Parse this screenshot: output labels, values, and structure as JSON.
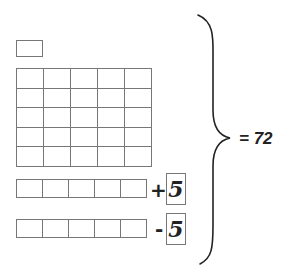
{
  "diagram": {
    "single_box": {
      "count": 1
    },
    "grid": {
      "rows": 5,
      "cols": 5
    },
    "plus_row": {
      "cells": 5,
      "operator": "+",
      "value": "5"
    },
    "minus_row": {
      "cells": 5,
      "operator": "-",
      "value": "5"
    },
    "brace": {
      "direction": "right"
    },
    "result": "= 72"
  },
  "colors": {
    "stroke": "#777777",
    "text": "#222222",
    "background": "#ffffff"
  }
}
